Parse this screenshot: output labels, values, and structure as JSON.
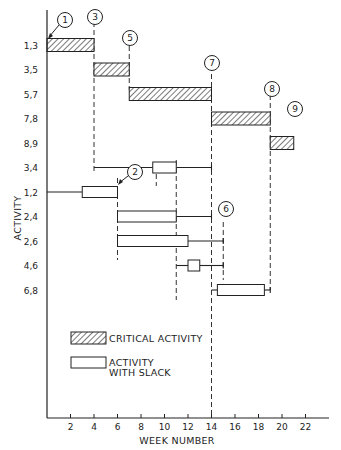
{
  "chart_data": {
    "type": "gantt",
    "title": "",
    "xlabel": "WEEK NUMBER",
    "ylabel": "ACTIVITY",
    "xlim": [
      0,
      23.5
    ],
    "x_ticks": [
      2,
      4,
      6,
      8,
      10,
      12,
      14,
      16,
      18,
      20,
      22
    ],
    "activities": [
      {
        "label": "1,3",
        "type": "critical",
        "start": 0,
        "end": 4
      },
      {
        "label": "3,5",
        "type": "critical",
        "start": 4,
        "end": 7
      },
      {
        "label": "5,7",
        "type": "critical",
        "start": 7,
        "end": 14
      },
      {
        "label": "7,8",
        "type": "critical",
        "start": 14,
        "end": 19
      },
      {
        "label": "8,9",
        "type": "critical",
        "start": 19,
        "end": 21
      },
      {
        "label": "3,4",
        "type": "slack",
        "line_start": 4,
        "start": 9,
        "end": 11,
        "line_end": 14
      },
      {
        "label": "1,2",
        "type": "slack",
        "line_start": 0,
        "start": 3,
        "end": 6,
        "line_end": 6
      },
      {
        "label": "2,4",
        "type": "slack",
        "line_start": 6,
        "start": 6,
        "end": 11,
        "line_end": 14
      },
      {
        "label": "2,6",
        "type": "slack",
        "line_start": 6,
        "start": 6,
        "end": 12,
        "line_end": 15
      },
      {
        "label": "4,6",
        "type": "slack",
        "line_start": 11,
        "start": 12,
        "end": 13,
        "line_end": 15
      },
      {
        "label": "6,8",
        "type": "slack",
        "line_start": 14,
        "start": 14.5,
        "end": 18.5,
        "line_end": 19
      }
    ],
    "nodes": [
      {
        "id": "1",
        "week": 0
      },
      {
        "id": "2",
        "week": 6
      },
      {
        "id": "3",
        "week": 4
      },
      {
        "id": "5",
        "week": 7
      },
      {
        "id": "6",
        "week": 15
      },
      {
        "id": "7",
        "week": 14
      },
      {
        "id": "8",
        "week": 19
      },
      {
        "id": "9",
        "week": 21
      }
    ],
    "legend": [
      {
        "label": "CRITICAL ACTIVITY",
        "style": "hatched"
      },
      {
        "label": "ACTIVITY WITH SLACK",
        "style": "open"
      }
    ],
    "grid": false,
    "legend_position": "lower-left inside plot"
  },
  "legend": {
    "critical": "CRITICAL ACTIVITY",
    "slack_line1": "ACTIVITY",
    "slack_line2": "WITH SLACK"
  },
  "axis": {
    "x_title": "WEEK NUMBER",
    "y_title": "ACTIVITY"
  }
}
